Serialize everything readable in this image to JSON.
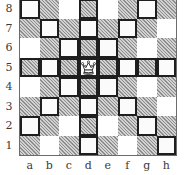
{
  "diagram": {
    "files": [
      "a",
      "b",
      "c",
      "d",
      "e",
      "f",
      "g",
      "h"
    ],
    "ranks": [
      "8",
      "7",
      "6",
      "5",
      "4",
      "3",
      "2",
      "1"
    ],
    "pieces": [
      {
        "square": "d5",
        "piece": "queen",
        "color": "white",
        "icon": "white-queen-icon",
        "glyph": "♕"
      }
    ],
    "highlighted_squares": [
      "a8",
      "d8",
      "g8",
      "b7",
      "d7",
      "f7",
      "c6",
      "d6",
      "e6",
      "a5",
      "b5",
      "c5",
      "e5",
      "f5",
      "g5",
      "h5",
      "c4",
      "d4",
      "e4",
      "b3",
      "d3",
      "f3",
      "a2",
      "d2",
      "g2",
      "d1",
      "h1"
    ],
    "colors": {
      "light_square": "#ffffff",
      "dark_square_hatch": "#b9b9b9",
      "highlight_border": "#1e1e1e",
      "label_text": "#3a3a3a"
    }
  }
}
